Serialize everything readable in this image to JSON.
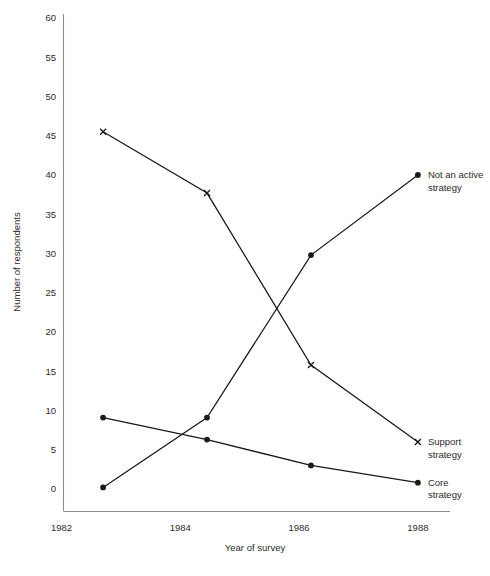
{
  "chart_data": {
    "type": "line",
    "title": "",
    "xlabel": "Year of survey",
    "ylabel": "Number of respondents",
    "xlim": [
      1982,
      1988.6
    ],
    "ylim": [
      0,
      60
    ],
    "grid": false,
    "legend_position": "inline-right",
    "xticks": [
      1982,
      1984,
      1986,
      1988
    ],
    "xtick_labels": [
      "1982",
      "1984",
      "1986",
      "1988"
    ],
    "yticks": [
      0,
      5,
      10,
      15,
      20,
      25,
      30,
      35,
      40,
      45,
      50,
      55,
      60
    ],
    "ytick_labels": [
      "0",
      "5",
      "10",
      "15",
      "20",
      "25",
      "30",
      "35",
      "40",
      "45",
      "50",
      "55",
      "60"
    ],
    "series": [
      {
        "name": "Support strategy",
        "marker": "cross",
        "label_lines": [
          "Support",
          "strategy"
        ],
        "x": [
          1982.7,
          1984.45,
          1986.2,
          1988.0
        ],
        "values": [
          45.5,
          37.7,
          15.8,
          6.0
        ]
      },
      {
        "name": "Not an active strategy",
        "marker": "dot",
        "label_lines": [
          "Not an active",
          "strategy"
        ],
        "x": [
          1982.7,
          1984.45,
          1986.2,
          1988.0
        ],
        "values": [
          0.2,
          9.1,
          29.8,
          40.0
        ]
      },
      {
        "name": "Core strategy",
        "marker": "dot",
        "label_lines": [
          "Core",
          "strategy"
        ],
        "x": [
          1982.7,
          1984.45,
          1986.2,
          1988.0
        ],
        "values": [
          9.1,
          6.3,
          3.0,
          0.8
        ]
      }
    ]
  },
  "labels": {
    "not_an_active_strategy_line1": "Not an active",
    "not_an_active_strategy_line2": "strategy",
    "support_strategy_line1": "Support",
    "support_strategy_line2": "strategy",
    "core_strategy_line1": "Core",
    "core_strategy_line2": "strategy",
    "x_axis_title": "Year of survey",
    "y_axis_title": "Number of respondents"
  },
  "colors": {
    "ink": "#1a1a1a",
    "axis": "#8c8c8c",
    "background": "#ffffff"
  }
}
